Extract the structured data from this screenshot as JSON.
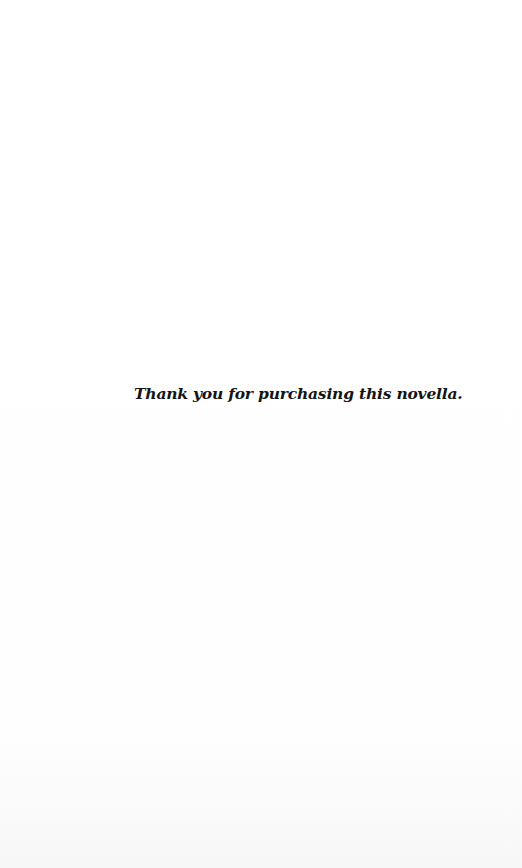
{
  "page": {
    "message": "Thank you for purchasing this novella."
  }
}
